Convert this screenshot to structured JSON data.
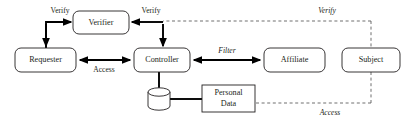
{
  "diagram": {
    "background_color": "#ffffff",
    "stroke_color": "#231f20",
    "solid_edge_color": "#000000",
    "dashed_edge_color": "#555555",
    "nodes": [
      {
        "id": "requester",
        "label": "Requester",
        "shape": "rounded-rect",
        "x": 15,
        "y": 48,
        "w": 61,
        "h": 24
      },
      {
        "id": "verifier",
        "label": "Verifier",
        "shape": "rounded-rect",
        "x": 73,
        "y": 11,
        "w": 56,
        "h": 23
      },
      {
        "id": "controller",
        "label": "Controller",
        "shape": "rounded-rect",
        "x": 134,
        "y": 48,
        "w": 56,
        "h": 24
      },
      {
        "id": "affiliate",
        "label": "Affiliate",
        "shape": "rounded-rect",
        "x": 264,
        "y": 48,
        "w": 61,
        "h": 24
      },
      {
        "id": "subject",
        "label": "Subject",
        "shape": "rounded-rect",
        "x": 342,
        "y": 48,
        "w": 58,
        "h": 24
      },
      {
        "id": "personal-data",
        "label": "Personal",
        "label2": "Data",
        "shape": "rect",
        "x": 202,
        "y": 85,
        "w": 53,
        "h": 27
      },
      {
        "id": "database",
        "label": "",
        "shape": "cylinder",
        "x": 148,
        "y": 88,
        "w": 22,
        "h": 22
      }
    ],
    "edges": [
      {
        "id": "requester-to-verifier",
        "label": "Verify",
        "style": "solid",
        "italic": false,
        "from": "requester",
        "to": "verifier"
      },
      {
        "id": "controller-to-verifier",
        "label": "Verify",
        "style": "solid",
        "italic": false,
        "from": "controller",
        "to": "verifier"
      },
      {
        "id": "requester-controller-access",
        "label": "Access",
        "style": "solid",
        "italic": false,
        "from": "requester",
        "to": "controller"
      },
      {
        "id": "controller-affiliate-filter",
        "label": "Filter",
        "style": "solid",
        "italic": true,
        "from": "controller",
        "to": "affiliate"
      },
      {
        "id": "controller-to-database",
        "label": "",
        "style": "solid",
        "italic": false,
        "from": "controller",
        "to": "database"
      },
      {
        "id": "database-to-personal-data",
        "label": "",
        "style": "solid",
        "italic": false,
        "from": "database",
        "to": "personal-data"
      },
      {
        "id": "subject-verify",
        "label": "Verify",
        "style": "dashed",
        "italic": true,
        "from": "subject",
        "to": "verifier"
      },
      {
        "id": "subject-access",
        "label": "Access",
        "style": "dashed",
        "italic": true,
        "from": "subject",
        "to": "personal-data"
      }
    ],
    "labels": {
      "verify_left": "Verify",
      "verify_right": "Verify",
      "access_mid": "Access",
      "filter": "Filter",
      "verify_dashed": "Verify",
      "access_dashed": "Access",
      "requester": "Requester",
      "verifier": "Verifier",
      "controller": "Controller",
      "affiliate": "Affiliate",
      "subject": "Subject",
      "personal_data_line1": "Personal",
      "personal_data_line2": "Data"
    }
  }
}
